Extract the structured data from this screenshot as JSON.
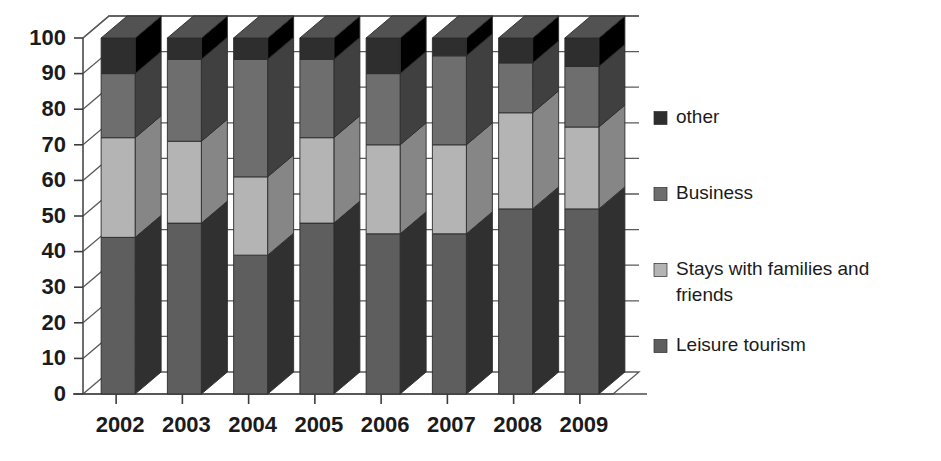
{
  "chart_data": {
    "type": "bar",
    "subtype": "stacked-3d-column",
    "title": "",
    "subtitle": "",
    "xlabel": "",
    "ylabel": "",
    "categories": [
      "2002",
      "2003",
      "2004",
      "2005",
      "2006",
      "2007",
      "2008",
      "2009"
    ],
    "series": [
      {
        "name": "Leisure tourism",
        "color": "#5e5e5e",
        "values": [
          44,
          48,
          39,
          48,
          45,
          45,
          52,
          52
        ]
      },
      {
        "name": "Stays with families and friends",
        "color": "#b4b4b4",
        "values": [
          28,
          23,
          22,
          24,
          25,
          25,
          27,
          23
        ]
      },
      {
        "name": "Business",
        "color": "#6e6e6e",
        "values": [
          18,
          23,
          33,
          22,
          20,
          25,
          14,
          17
        ]
      },
      {
        "name": "other",
        "color": "#2e2e2e",
        "values": [
          10,
          6,
          6,
          6,
          10,
          5,
          7,
          8
        ]
      }
    ],
    "cumulative_tops": [
      [
        44,
        72,
        90,
        100
      ],
      [
        48,
        71,
        94,
        100
      ],
      [
        39,
        61,
        94,
        100
      ],
      [
        48,
        72,
        94,
        100
      ],
      [
        45,
        70,
        90,
        100
      ],
      [
        45,
        70,
        95,
        100
      ],
      [
        52,
        79,
        93,
        100
      ],
      [
        52,
        75,
        92,
        100
      ]
    ],
    "yticks": [
      0,
      10,
      20,
      30,
      40,
      50,
      60,
      70,
      80,
      90,
      100
    ],
    "ylim": [
      0,
      100
    ],
    "grid": true,
    "legend_position": "right",
    "legend": [
      {
        "label": "other",
        "color": "#2e2e2e"
      },
      {
        "label": "Business",
        "color": "#6e6e6e"
      },
      {
        "label": "Stays with families and friends",
        "color": "#b4b4b4"
      },
      {
        "label": "Leisure tourism",
        "color": "#5e5e5e"
      }
    ]
  },
  "colors": {
    "other": "#2e2e2e",
    "business": "#6e6e6e",
    "stays": "#b4b4b4",
    "leisure": "#5e5e5e",
    "axis": "#4a4a4a",
    "grid": "#5a5a5a",
    "text": "#1b1b1b",
    "background": "#ffffff"
  }
}
